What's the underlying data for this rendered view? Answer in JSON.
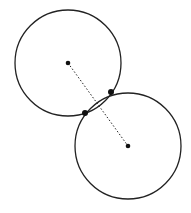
{
  "figure": {
    "stroke_color": "#222222",
    "background": "#ffffff",
    "circles": [
      {
        "name": "upper-circle",
        "cx": 68,
        "cy": 63,
        "r": 53
      },
      {
        "name": "lower-circle",
        "cx": 128,
        "cy": 146,
        "r": 53
      }
    ],
    "centers": [
      {
        "name": "upper-center",
        "x": 68,
        "y": 63
      },
      {
        "name": "lower-center",
        "x": 128,
        "y": 146
      }
    ],
    "intersection_points": [
      {
        "name": "intersection-upper-right",
        "x": 111,
        "y": 92
      },
      {
        "name": "intersection-lower-left",
        "x": 85,
        "y": 113
      }
    ],
    "center_line": {
      "x1": 68,
      "y1": 63,
      "x2": 128,
      "y2": 146,
      "style": "dotted"
    }
  }
}
